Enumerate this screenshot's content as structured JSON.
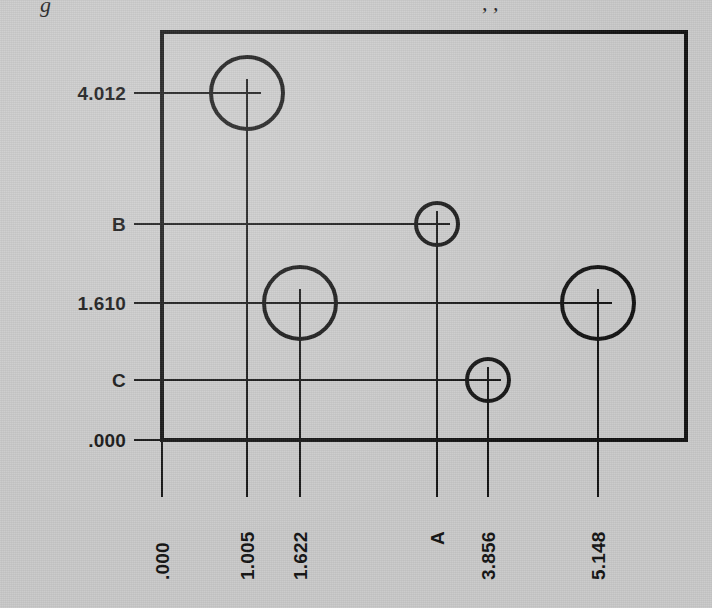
{
  "drawing": {
    "title_partial_clipped": "g",
    "title_clipped_right": ", ,",
    "background_color": "#c8c8c8",
    "ink_color": "#101010",
    "part_outline": {
      "name": "part-outline-rectangle",
      "x": 162,
      "y": 32,
      "width": 524,
      "height": 408,
      "stroke_width": 4
    },
    "holes": [
      {
        "id": "hole-1",
        "cx": 247,
        "cy": 93,
        "r": 36,
        "x_label": "1.005",
        "y_label": "4.012"
      },
      {
        "id": "hole-2",
        "cx": 437,
        "cy": 224,
        "r": 21,
        "x_label": "A",
        "y_label": "B"
      },
      {
        "id": "hole-3",
        "cx": 300,
        "cy": 303,
        "r": 36,
        "x_label": "1.622",
        "y_label": "1.610"
      },
      {
        "id": "hole-4",
        "cx": 598,
        "cy": 303,
        "r": 36,
        "x_label": "5.148",
        "y_label": "1.610"
      },
      {
        "id": "hole-5",
        "cx": 488,
        "cy": 380,
        "r": 21,
        "x_label": "3.856",
        "y_label": "C"
      }
    ],
    "y_dimensions": [
      {
        "id": "y-dim-4012",
        "label": "4.012",
        "y": 93,
        "text_x": 126,
        "leader_from": 134,
        "leader_to": 247
      },
      {
        "id": "y-dim-b",
        "label": "B",
        "y": 224,
        "text_x": 126,
        "leader_from": 134,
        "leader_to": 437
      },
      {
        "id": "y-dim-1610",
        "label": "1.610",
        "y": 303,
        "text_x": 126,
        "leader_from": 134,
        "leader_to": 598
      },
      {
        "id": "y-dim-c",
        "label": "C",
        "y": 380,
        "text_x": 126,
        "leader_from": 134,
        "leader_to": 488
      },
      {
        "id": "y-dim-000",
        "label": ".000",
        "y": 440,
        "text_x": 126,
        "leader_from": 134,
        "leader_to": 162
      }
    ],
    "x_dimensions": [
      {
        "id": "x-dim-000",
        "label": ".000",
        "x": 162,
        "text_y": 580,
        "leader_from": 440,
        "leader_to": 497
      },
      {
        "id": "x-dim-1005",
        "label": "1.005",
        "x": 247,
        "text_y": 580,
        "leader_from": 93,
        "leader_to": 497
      },
      {
        "id": "x-dim-1622",
        "label": "1.622",
        "x": 300,
        "text_y": 580,
        "leader_from": 303,
        "leader_to": 497
      },
      {
        "id": "x-dim-a",
        "label": "A",
        "x": 437,
        "text_y": 580,
        "leader_from": 224,
        "leader_to": 497
      },
      {
        "id": "x-dim-3856",
        "label": "3.856",
        "x": 488,
        "text_y": 580,
        "leader_from": 380,
        "leader_to": 497
      },
      {
        "id": "x-dim-5148",
        "label": "5.148",
        "x": 598,
        "text_y": 580,
        "leader_from": 303,
        "leader_to": 497
      }
    ]
  }
}
